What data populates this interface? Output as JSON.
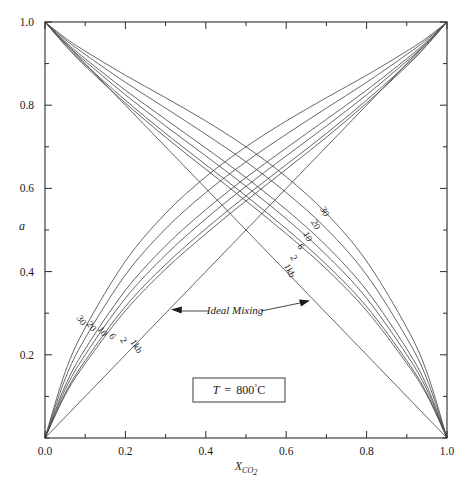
{
  "chart_data": {
    "type": "line",
    "title": "",
    "xlabel": "X_CO2",
    "ylabel": "a",
    "xlim": [
      0.0,
      1.0
    ],
    "ylim": [
      0.0,
      1.0
    ],
    "grid": false,
    "legend": "none",
    "x_ticklabels": [
      "0.0",
      "0.2",
      "0.4",
      "0.6",
      "0.8",
      "1.0"
    ],
    "x_tickvalues": [
      0.0,
      0.2,
      0.4,
      0.6,
      0.8,
      1.0
    ],
    "x_minor_step": 0.1,
    "y_ticklabels": [
      "0.2",
      "0.4",
      "0.6",
      "0.8",
      "1.0"
    ],
    "y_tickvalues": [
      0.2,
      0.4,
      0.6,
      0.8,
      1.0
    ],
    "y_minor_step": 0.1,
    "condition_box": "T  =  800°C",
    "condition_temperature": "800",
    "condition_units": "°C",
    "annotation": "Ideal Mixing",
    "pressure_labels": [
      "30",
      "20",
      "10",
      "6",
      "2",
      "1kb"
    ],
    "pressure_values_kb": [
      30,
      20,
      10,
      6,
      2,
      1
    ],
    "series": [
      {
        "name": "a_H2O 30 kb",
        "label": "30",
        "direction": "descending",
        "x": [
          0.0,
          0.05,
          0.1,
          0.2,
          0.3,
          0.4,
          0.5,
          0.6,
          0.7,
          0.8,
          0.9,
          0.95,
          1.0
        ],
        "values": [
          1.0,
          0.962,
          0.93,
          0.872,
          0.818,
          0.762,
          0.7,
          0.628,
          0.54,
          0.425,
          0.265,
          0.158,
          0.0
        ]
      },
      {
        "name": "a_H2O 20 kb",
        "label": "20",
        "direction": "descending",
        "x": [
          0.0,
          0.05,
          0.1,
          0.2,
          0.3,
          0.4,
          0.5,
          0.6,
          0.7,
          0.8,
          0.9,
          0.95,
          1.0
        ],
        "values": [
          1.0,
          0.958,
          0.922,
          0.855,
          0.793,
          0.73,
          0.664,
          0.59,
          0.503,
          0.392,
          0.24,
          0.142,
          0.0
        ]
      },
      {
        "name": "a_H2O 10 kb",
        "label": "10",
        "direction": "descending",
        "x": [
          0.0,
          0.05,
          0.1,
          0.2,
          0.3,
          0.4,
          0.5,
          0.6,
          0.7,
          0.8,
          0.9,
          0.95,
          1.0
        ],
        "values": [
          1.0,
          0.953,
          0.912,
          0.836,
          0.766,
          0.697,
          0.626,
          0.549,
          0.462,
          0.355,
          0.214,
          0.125,
          0.0
        ]
      },
      {
        "name": "a_H2O 6 kb",
        "label": "6",
        "direction": "descending",
        "x": [
          0.0,
          0.05,
          0.1,
          0.2,
          0.3,
          0.4,
          0.5,
          0.6,
          0.7,
          0.8,
          0.9,
          0.95,
          1.0
        ],
        "values": [
          1.0,
          0.95,
          0.906,
          0.825,
          0.75,
          0.678,
          0.605,
          0.527,
          0.44,
          0.336,
          0.2,
          0.116,
          0.0
        ]
      },
      {
        "name": "a_H2O 2 kb",
        "label": "2",
        "direction": "descending",
        "x": [
          0.0,
          0.05,
          0.1,
          0.2,
          0.3,
          0.4,
          0.5,
          0.6,
          0.7,
          0.8,
          0.9,
          0.95,
          1.0
        ],
        "values": [
          1.0,
          0.946,
          0.898,
          0.812,
          0.732,
          0.657,
          0.582,
          0.503,
          0.417,
          0.316,
          0.186,
          0.107,
          0.0
        ]
      },
      {
        "name": "a_H2O 1 kb",
        "label": "1kb",
        "direction": "descending",
        "x": [
          0.0,
          0.05,
          0.1,
          0.2,
          0.3,
          0.4,
          0.5,
          0.6,
          0.7,
          0.8,
          0.9,
          0.95,
          1.0
        ],
        "values": [
          1.0,
          0.944,
          0.894,
          0.805,
          0.723,
          0.646,
          0.57,
          0.491,
          0.406,
          0.306,
          0.179,
          0.103,
          0.0
        ]
      },
      {
        "name": "a_H2O ideal",
        "label": "Ideal Mixing",
        "direction": "descending-ideal",
        "x": [
          0.0,
          1.0
        ],
        "values": [
          1.0,
          0.0
        ]
      },
      {
        "name": "a_CO2 30 kb",
        "label": "30",
        "direction": "ascending",
        "x": [
          0.0,
          0.05,
          0.1,
          0.2,
          0.3,
          0.4,
          0.5,
          0.6,
          0.7,
          0.8,
          0.9,
          0.95,
          1.0
        ],
        "values": [
          0.0,
          0.158,
          0.265,
          0.425,
          0.54,
          0.628,
          0.7,
          0.762,
          0.818,
          0.872,
          0.93,
          0.962,
          1.0
        ]
      },
      {
        "name": "a_CO2 20 kb",
        "label": "20",
        "direction": "ascending",
        "x": [
          0.0,
          0.05,
          0.1,
          0.2,
          0.3,
          0.4,
          0.5,
          0.6,
          0.7,
          0.8,
          0.9,
          0.95,
          1.0
        ],
        "values": [
          0.0,
          0.142,
          0.24,
          0.392,
          0.503,
          0.59,
          0.664,
          0.73,
          0.793,
          0.855,
          0.922,
          0.958,
          1.0
        ]
      },
      {
        "name": "a_CO2 10 kb",
        "label": "10",
        "direction": "ascending",
        "x": [
          0.0,
          0.05,
          0.1,
          0.2,
          0.3,
          0.4,
          0.5,
          0.6,
          0.7,
          0.8,
          0.9,
          0.95,
          1.0
        ],
        "values": [
          0.0,
          0.125,
          0.214,
          0.355,
          0.462,
          0.549,
          0.626,
          0.697,
          0.766,
          0.836,
          0.912,
          0.953,
          1.0
        ]
      },
      {
        "name": "a_CO2 6 kb",
        "label": "6",
        "direction": "ascending",
        "x": [
          0.0,
          0.05,
          0.1,
          0.2,
          0.3,
          0.4,
          0.5,
          0.6,
          0.7,
          0.8,
          0.9,
          0.95,
          1.0
        ],
        "values": [
          0.0,
          0.116,
          0.2,
          0.336,
          0.44,
          0.527,
          0.605,
          0.678,
          0.75,
          0.825,
          0.906,
          0.95,
          1.0
        ]
      },
      {
        "name": "a_CO2 2 kb",
        "label": "2",
        "direction": "ascending",
        "x": [
          0.0,
          0.05,
          0.1,
          0.2,
          0.3,
          0.4,
          0.5,
          0.6,
          0.7,
          0.8,
          0.9,
          0.95,
          1.0
        ],
        "values": [
          0.0,
          0.107,
          0.186,
          0.316,
          0.417,
          0.503,
          0.582,
          0.657,
          0.732,
          0.812,
          0.898,
          0.946,
          1.0
        ]
      },
      {
        "name": "a_CO2 1 kb",
        "label": "1kb",
        "direction": "ascending",
        "x": [
          0.0,
          0.05,
          0.1,
          0.2,
          0.3,
          0.4,
          0.5,
          0.6,
          0.7,
          0.8,
          0.9,
          0.95,
          1.0
        ],
        "values": [
          0.0,
          0.103,
          0.179,
          0.306,
          0.406,
          0.491,
          0.57,
          0.646,
          0.723,
          0.805,
          0.894,
          0.944,
          1.0
        ]
      },
      {
        "name": "a_CO2 ideal",
        "label": "Ideal Mixing",
        "direction": "ascending-ideal",
        "x": [
          0.0,
          1.0
        ],
        "values": [
          0.0,
          1.0
        ]
      }
    ],
    "colors": {
      "curve": "#4a4a4a",
      "axis": "#2a2a2a",
      "text": "#1a1a1a",
      "background": "#ffffff"
    }
  },
  "axis": {
    "y_label": "a",
    "x_label_main": "X",
    "x_label_sub": "CO",
    "x_label_sub2": "2"
  },
  "labels": {
    "upper_right_group": [
      "30",
      "20",
      "10",
      "6",
      "2",
      "1kb"
    ],
    "lower_left_group": [
      "30",
      "20",
      "10",
      "6",
      "2",
      "1kb"
    ],
    "ideal_mixing": "Ideal Mixing",
    "condition": "T  =  800",
    "condition_deg": "°",
    "condition_c": "C",
    "condition_t": "T",
    "condition_eq": "="
  }
}
